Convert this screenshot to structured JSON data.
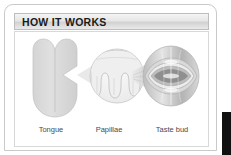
{
  "card": {
    "header": {
      "title": "HOW IT WORKS"
    },
    "diagram": {
      "stages": [
        {
          "label": "Tongue",
          "icon": "tongue-icon"
        },
        {
          "label": "Papillae",
          "icon": "papillae-circle-icon"
        },
        {
          "label": "Taste bud",
          "icon": "taste-bud-icon"
        }
      ],
      "connectors": [
        {
          "name": "arrow-tongue-to-papillae",
          "direction": "left"
        },
        {
          "name": "wedge-papillae-to-tastebud",
          "direction": "left"
        }
      ]
    }
  },
  "colors": {
    "header_text": "#1a1a1a",
    "header_bar_light": "#f4f4f4",
    "header_bar_dark": "#d2d2d2",
    "card_border": "#c9c9c9",
    "label_text": "#4a4a4a",
    "illustration_light": "#e2e2e2",
    "illustration_mid": "#c4c4c4",
    "illustration_dark": "#8f8f8f",
    "page_background": "#ffffff",
    "edge_strip": "#111111"
  }
}
